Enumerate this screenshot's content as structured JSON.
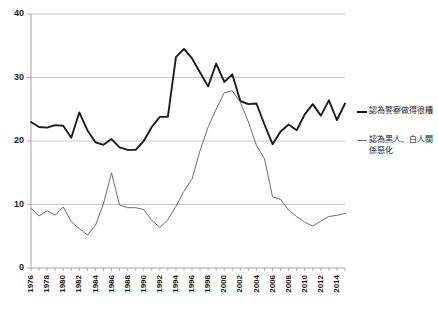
{
  "chart_data": {
    "type": "line",
    "title": "",
    "subtitle": "",
    "xlabel": "",
    "ylabel": "",
    "xlim": [
      1976,
      2015
    ],
    "ylim": [
      0,
      40
    ],
    "yticks": [
      0,
      10,
      20,
      30,
      40
    ],
    "ytick_labels": [
      "0",
      "10",
      "20",
      "30",
      "40"
    ],
    "grid": true,
    "grid_axis": "y",
    "legend_position": "right",
    "xtick_labels": [
      "1976",
      "1978",
      "1980",
      "1982",
      "1984",
      "1986",
      "1988",
      "1990",
      "1992",
      "1994",
      "1996",
      "1998",
      "2000",
      "2002",
      "2004",
      "2006",
      "2008",
      "2010",
      "2012",
      "2014"
    ],
    "x": [
      1976,
      1977,
      1978,
      1979,
      1980,
      1981,
      1982,
      1983,
      1984,
      1985,
      1986,
      1987,
      1988,
      1989,
      1990,
      1991,
      1992,
      1993,
      1994,
      1995,
      1996,
      1997,
      1998,
      1999,
      2000,
      2001,
      2002,
      2003,
      2004,
      2005,
      2006,
      2007,
      2008,
      2009,
      2010,
      2011,
      2012,
      2013,
      2014,
      2015
    ],
    "series": [
      {
        "name": "認為警察做得很糟",
        "color": "#1c1c1c",
        "width": 1.9,
        "values": [
          23.0,
          22.2,
          22.1,
          22.5,
          22.4,
          20.5,
          24.5,
          21.7,
          19.8,
          19.4,
          20.3,
          19.0,
          18.6,
          18.6,
          20.0,
          22.2,
          23.8,
          23.8,
          33.2,
          34.5,
          33.0,
          30.8,
          28.6,
          32.2,
          29.3,
          30.5,
          26.3,
          25.8,
          25.9,
          22.6,
          19.5,
          21.5,
          22.6,
          21.7,
          24.2,
          25.8,
          24.0,
          26.4,
          23.3,
          25.9
        ]
      },
      {
        "name": "認為黑人、白人關係惡化",
        "color": "#6e6e6e",
        "width": 1.0,
        "values": [
          9.4,
          8.2,
          9.0,
          8.3,
          9.6,
          7.3,
          6.2,
          5.2,
          6.7,
          10.1,
          15.0,
          9.9,
          9.5,
          9.5,
          9.2,
          7.5,
          6.4,
          7.6,
          9.7,
          12.1,
          14.0,
          18.5,
          22.2,
          25.0,
          27.6,
          27.9,
          26.1,
          23.0,
          19.3,
          17.2,
          11.2,
          10.8,
          9.1,
          8.1,
          7.2,
          6.6,
          7.4,
          8.1,
          8.3,
          8.6
        ]
      }
    ]
  },
  "legend": {
    "entries": [
      {
        "label": "認為警察做得很糟",
        "series": "police"
      },
      {
        "label": "認為黑人、白人關係惡化",
        "series": "race"
      }
    ]
  },
  "axis": {
    "y_ticks": [
      "0",
      "10",
      "20",
      "30",
      "40"
    ],
    "x_ticks": [
      "1976",
      "1978",
      "1980",
      "1982",
      "1984",
      "1986",
      "1988",
      "1990",
      "1992",
      "1994",
      "1996",
      "1998",
      "2000",
      "2002",
      "2004",
      "2006",
      "2008",
      "2010",
      "2012",
      "2014"
    ]
  }
}
